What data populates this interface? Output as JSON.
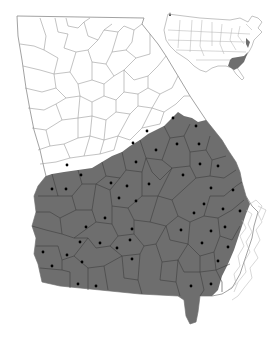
{
  "map": {
    "title": "Georgia county distribution map",
    "region": "Georgia, USA",
    "colors": {
      "range_fill": "#6e6e6e",
      "background": "#ffffff",
      "county_line_unshaded": "#9a9a9a",
      "county_line_shaded": "#3e3e3e",
      "record_dot": "#000000"
    },
    "legend": {
      "shaded": "Distribution range (Coastal Plain)",
      "dot": "County record"
    },
    "inset": {
      "label": "United States inset",
      "highlight": "Southeastern coastal plain"
    },
    "record_dots": [
      {
        "x": 173,
        "y": 118
      },
      {
        "x": 147,
        "y": 131
      },
      {
        "x": 133,
        "y": 143
      },
      {
        "x": 196,
        "y": 126
      },
      {
        "x": 177,
        "y": 144
      },
      {
        "x": 199,
        "y": 144
      },
      {
        "x": 156,
        "y": 150
      },
      {
        "x": 136,
        "y": 162
      },
      {
        "x": 200,
        "y": 164
      },
      {
        "x": 218,
        "y": 166
      },
      {
        "x": 67,
        "y": 165
      },
      {
        "x": 81,
        "y": 175
      },
      {
        "x": 183,
        "y": 175
      },
      {
        "x": 52,
        "y": 189
      },
      {
        "x": 66,
        "y": 189
      },
      {
        "x": 111,
        "y": 183
      },
      {
        "x": 127,
        "y": 186
      },
      {
        "x": 149,
        "y": 184
      },
      {
        "x": 211,
        "y": 188
      },
      {
        "x": 233,
        "y": 190
      },
      {
        "x": 119,
        "y": 198
      },
      {
        "x": 136,
        "y": 201
      },
      {
        "x": 204,
        "y": 204
      },
      {
        "x": 194,
        "y": 213
      },
      {
        "x": 223,
        "y": 209
      },
      {
        "x": 240,
        "y": 211
      },
      {
        "x": 105,
        "y": 218
      },
      {
        "x": 86,
        "y": 227
      },
      {
        "x": 132,
        "y": 229
      },
      {
        "x": 181,
        "y": 230
      },
      {
        "x": 211,
        "y": 231
      },
      {
        "x": 225,
        "y": 227
      },
      {
        "x": 80,
        "y": 242
      },
      {
        "x": 100,
        "y": 243
      },
      {
        "x": 130,
        "y": 240
      },
      {
        "x": 202,
        "y": 243
      },
      {
        "x": 117,
        "y": 248
      },
      {
        "x": 228,
        "y": 247
      },
      {
        "x": 43,
        "y": 252
      },
      {
        "x": 67,
        "y": 255
      },
      {
        "x": 82,
        "y": 262
      },
      {
        "x": 132,
        "y": 259
      },
      {
        "x": 218,
        "y": 261
      },
      {
        "x": 52,
        "y": 266
      },
      {
        "x": 78,
        "y": 284
      },
      {
        "x": 96,
        "y": 286
      },
      {
        "x": 191,
        "y": 286
      },
      {
        "x": 211,
        "y": 284
      }
    ]
  }
}
